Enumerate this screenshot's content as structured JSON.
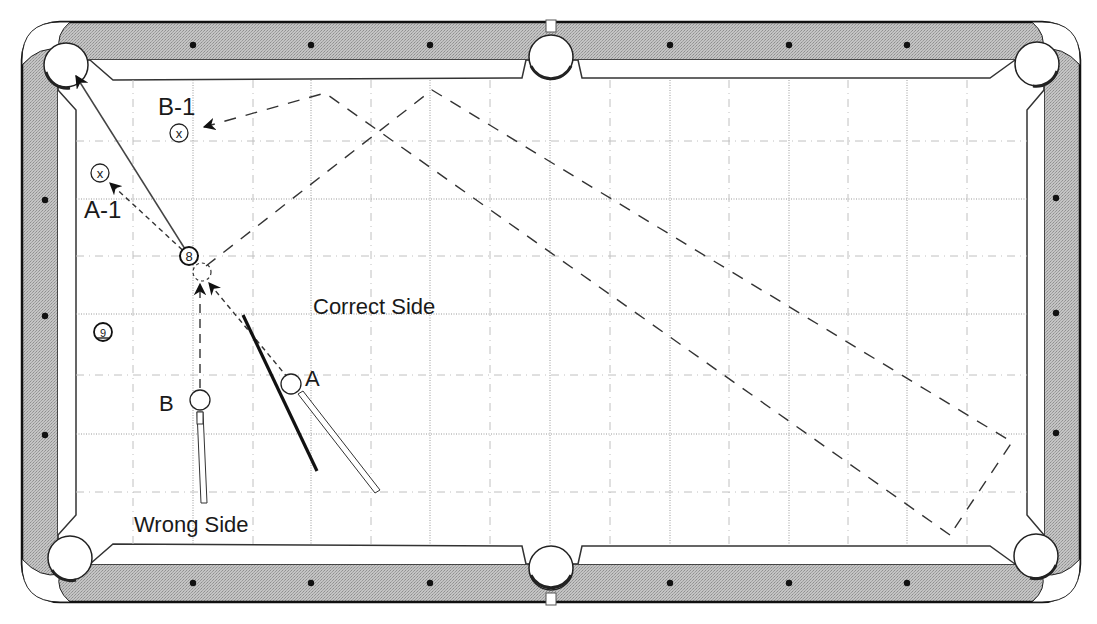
{
  "diagram": {
    "colors": {
      "rail": "#b9b9b9",
      "rail_outline": "#222222",
      "cloth": "#ffffff",
      "grid_major": "#9a9a9a",
      "grid_minor": "#bdbdbd",
      "path": "#333333",
      "diamond": "#111111"
    },
    "labels": {
      "b1": "B-1",
      "a1": "A-1",
      "correct_side": "Correct Side",
      "wrong_side": "Wrong Side",
      "a": "A",
      "b": "B"
    },
    "balls": {
      "eight": "8",
      "nine": "9",
      "target_mark": "x"
    },
    "pockets": [
      "top-left-corner",
      "top-side",
      "top-right-corner",
      "bottom-left-corner",
      "bottom-side",
      "bottom-right-corner"
    ],
    "diamonds": {
      "top": 6,
      "bottom": 6,
      "left": 3,
      "right": 3
    },
    "icons": [
      "pocket-icon",
      "diamond-icon",
      "cue-stick-icon",
      "arrow-icon"
    ]
  }
}
